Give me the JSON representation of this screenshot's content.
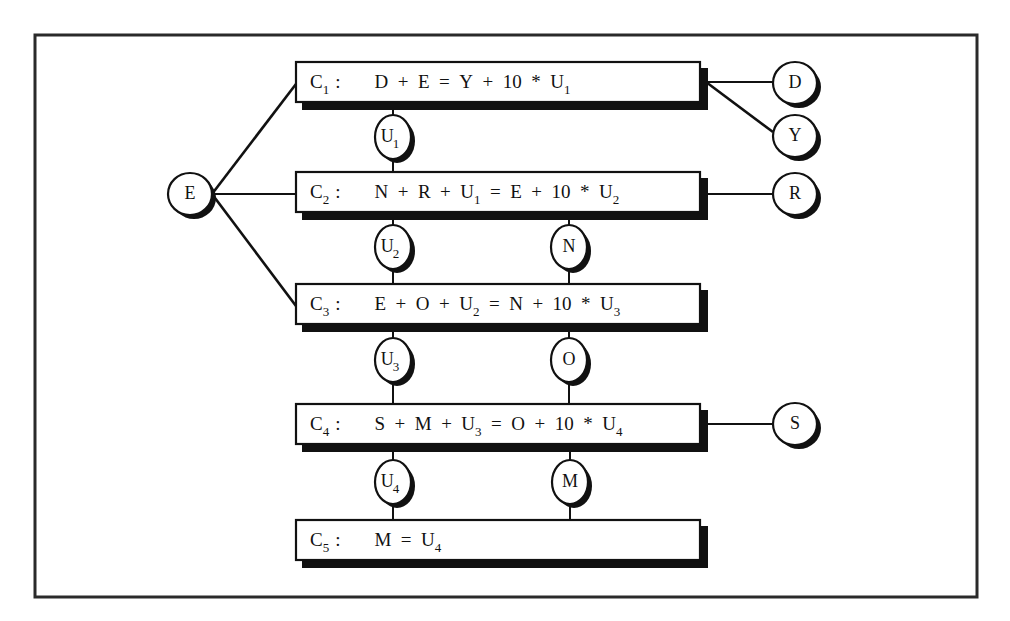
{
  "diagram": {
    "constraints": [
      {
        "id": "C1",
        "name": "C",
        "sub": "1",
        "sep": ":",
        "parts": [
          {
            "t": "D + E = Y + 10 * U"
          },
          {
            "s": "1"
          }
        ],
        "y": 62
      },
      {
        "id": "C2",
        "name": "C",
        "sub": "2",
        "sep": ":",
        "parts": [
          {
            "t": "N + R + U"
          },
          {
            "s": "1"
          },
          {
            "t": " = E + 10 * U"
          },
          {
            "s": "2"
          }
        ],
        "y": 172
      },
      {
        "id": "C3",
        "name": "C",
        "sub": "3",
        "sep": ":",
        "parts": [
          {
            "t": "E + O + U"
          },
          {
            "s": "2"
          },
          {
            "t": " = N + 10 * U"
          },
          {
            "s": "3"
          }
        ],
        "y": 284
      },
      {
        "id": "C4",
        "name": "C",
        "sub": "4",
        "sep": ":",
        "parts": [
          {
            "t": "S + M + U"
          },
          {
            "s": "3"
          },
          {
            "t": " = O + 10 * U"
          },
          {
            "s": "4"
          }
        ],
        "y": 404
      },
      {
        "id": "C5",
        "name": "C",
        "sub": "5",
        "sep": ":",
        "parts": [
          {
            "t": "M = U"
          },
          {
            "s": "4"
          }
        ],
        "y": 520
      }
    ],
    "variables": [
      {
        "id": "E",
        "label": "E",
        "sub": "",
        "x": 190,
        "y": 194,
        "rx": 22,
        "ry": 21
      },
      {
        "id": "D",
        "label": "D",
        "sub": "",
        "x": 795,
        "y": 83,
        "rx": 22,
        "ry": 21
      },
      {
        "id": "Y",
        "label": "Y",
        "sub": "",
        "x": 795,
        "y": 136,
        "rx": 22,
        "ry": 21
      },
      {
        "id": "R",
        "label": "R",
        "sub": "",
        "x": 795,
        "y": 194,
        "rx": 22,
        "ry": 21
      },
      {
        "id": "S",
        "label": "S",
        "sub": "",
        "x": 795,
        "y": 424,
        "rx": 22,
        "ry": 21
      },
      {
        "id": "U1",
        "label": "U",
        "sub": "1",
        "x": 393,
        "y": 137,
        "rx": 18,
        "ry": 22
      },
      {
        "id": "U2",
        "label": "U",
        "sub": "2",
        "x": 393,
        "y": 247,
        "rx": 18,
        "ry": 22
      },
      {
        "id": "U3",
        "label": "U",
        "sub": "3",
        "x": 393,
        "y": 360,
        "rx": 18,
        "ry": 22
      },
      {
        "id": "U4",
        "label": "U",
        "sub": "4",
        "x": 393,
        "y": 482,
        "rx": 18,
        "ry": 22
      },
      {
        "id": "N",
        "label": "N",
        "sub": "",
        "x": 569,
        "y": 247,
        "rx": 18,
        "ry": 22
      },
      {
        "id": "O",
        "label": "O",
        "sub": "",
        "x": 569,
        "y": 360,
        "rx": 18,
        "ry": 22
      },
      {
        "id": "M",
        "label": "M",
        "sub": "",
        "x": 570,
        "y": 482,
        "rx": 18,
        "ry": 22
      }
    ],
    "edges": [
      {
        "from": "E",
        "to": "C1",
        "x1": 212,
        "y1": 194,
        "x2": 296,
        "y2": 84,
        "w": 2.6
      },
      {
        "from": "E",
        "to": "C2",
        "x1": 212,
        "y1": 194,
        "x2": 296,
        "y2": 194,
        "w": 2
      },
      {
        "from": "E",
        "to": "C3",
        "x1": 212,
        "y1": 194,
        "x2": 296,
        "y2": 306,
        "w": 2.6
      },
      {
        "from": "C1",
        "to": "D",
        "x1": 706,
        "y1": 82,
        "x2": 773,
        "y2": 82,
        "w": 2.2
      },
      {
        "from": "C1",
        "to": "Y",
        "x1": 706,
        "y1": 82,
        "x2": 773,
        "y2": 132,
        "w": 2.6
      },
      {
        "from": "C2",
        "to": "R",
        "x1": 706,
        "y1": 194,
        "x2": 773,
        "y2": 194,
        "w": 2.2
      },
      {
        "from": "C4",
        "to": "S",
        "x1": 706,
        "y1": 424,
        "x2": 773,
        "y2": 424,
        "w": 2.2
      },
      {
        "from": "C1",
        "to": "U1",
        "x1": 393,
        "y1": 104,
        "x2": 393,
        "y2": 115,
        "w": 2
      },
      {
        "from": "U1",
        "to": "C2",
        "x1": 393,
        "y1": 159,
        "x2": 393,
        "y2": 172,
        "w": 2
      },
      {
        "from": "C2",
        "to": "U2",
        "x1": 393,
        "y1": 216,
        "x2": 393,
        "y2": 225,
        "w": 2
      },
      {
        "from": "U2",
        "to": "C3",
        "x1": 393,
        "y1": 269,
        "x2": 393,
        "y2": 284,
        "w": 2
      },
      {
        "from": "C2",
        "to": "N",
        "x1": 569,
        "y1": 216,
        "x2": 569,
        "y2": 225,
        "w": 2
      },
      {
        "from": "N",
        "to": "C3",
        "x1": 569,
        "y1": 269,
        "x2": 569,
        "y2": 284,
        "w": 2
      },
      {
        "from": "C3",
        "to": "U3",
        "x1": 393,
        "y1": 326,
        "x2": 393,
        "y2": 338,
        "w": 2
      },
      {
        "from": "U3",
        "to": "C4",
        "x1": 393,
        "y1": 382,
        "x2": 393,
        "y2": 404,
        "w": 2
      },
      {
        "from": "C3",
        "to": "O",
        "x1": 569,
        "y1": 326,
        "x2": 569,
        "y2": 338,
        "w": 2
      },
      {
        "from": "O",
        "to": "C4",
        "x1": 569,
        "y1": 382,
        "x2": 569,
        "y2": 404,
        "w": 2
      },
      {
        "from": "C4",
        "to": "U4",
        "x1": 393,
        "y1": 448,
        "x2": 393,
        "y2": 460,
        "w": 2
      },
      {
        "from": "U4",
        "to": "C5",
        "x1": 393,
        "y1": 504,
        "x2": 393,
        "y2": 520,
        "w": 2
      },
      {
        "from": "C4",
        "to": "M",
        "x1": 570,
        "y1": 448,
        "x2": 570,
        "y2": 460,
        "w": 2
      },
      {
        "from": "M",
        "to": "C5",
        "x1": 570,
        "y1": 504,
        "x2": 570,
        "y2": 520,
        "w": 2
      }
    ],
    "layout": {
      "frame": {
        "x": 35,
        "y": 35,
        "w": 942,
        "h": 562
      },
      "box": {
        "x": 296,
        "w": 404,
        "h": 40,
        "shadow": 6
      },
      "colors": {
        "ink": "#111111",
        "background": "#ffffff",
        "frame": "#2a2a2a"
      }
    }
  }
}
